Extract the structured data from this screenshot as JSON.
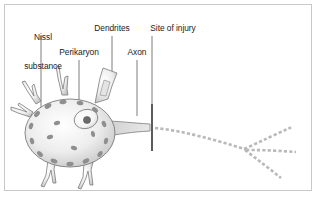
{
  "figure": {
    "kind": "neuron-anatomy-diagram",
    "background_color": "#ffffff",
    "border_color": "#c9c9c9",
    "ink_color": "#5a5a5a",
    "text_color": "#1b1b1b",
    "leader_line_color": "#6e6e6e",
    "soma_fill_light": "#fbfbfb",
    "soma_fill_dark": "#c4c4c4",
    "nissl_granule_color": "#8f8f8f",
    "nucleolus_color": "#6b6b6b",
    "degenerating_axon_color": "#b9b9b9"
  },
  "labels": {
    "nissl": "Nissl\nsubstance",
    "nissl_line1": "Nissl",
    "nissl_line2": "substance",
    "dendrites": "Dendrites",
    "site_of_injury": "Site of injury",
    "perikaryon": "Perikaryon",
    "axon": "Axon"
  },
  "structures": [
    {
      "name": "nissl-substance",
      "label": "Nissl substance",
      "description": "dark oval granules ringing the cell body"
    },
    {
      "name": "perikaryon",
      "label": "Perikaryon",
      "description": "cell body containing nucleus and nucleolus"
    },
    {
      "name": "dendrites",
      "label": "Dendrites",
      "description": "branching processes radiating from the soma"
    },
    {
      "name": "axon",
      "label": "Axon",
      "description": "single tapering process leaving the soma"
    },
    {
      "name": "site-of-injury",
      "label": "Site of injury",
      "description": "vertical bar transecting the axon"
    },
    {
      "name": "degenerating-axon",
      "label": "",
      "description": "dashed distal axon segment branching into three terminals"
    }
  ],
  "leader_lines": [
    {
      "name": "leader-nissl",
      "x1": 41,
      "y1": 36,
      "x2": 41,
      "y2": 124
    },
    {
      "name": "leader-dendrites",
      "x1": 112,
      "y1": 36,
      "x2": 112,
      "y2": 72
    },
    {
      "name": "leader-injury",
      "x1": 152,
      "y1": 36,
      "x2": 152,
      "y2": 104
    },
    {
      "name": "leader-perikaryon",
      "x1": 79,
      "y1": 60,
      "x2": 79,
      "y2": 104
    },
    {
      "name": "leader-axon",
      "x1": 137,
      "y1": 60,
      "x2": 137,
      "y2": 116
    }
  ]
}
